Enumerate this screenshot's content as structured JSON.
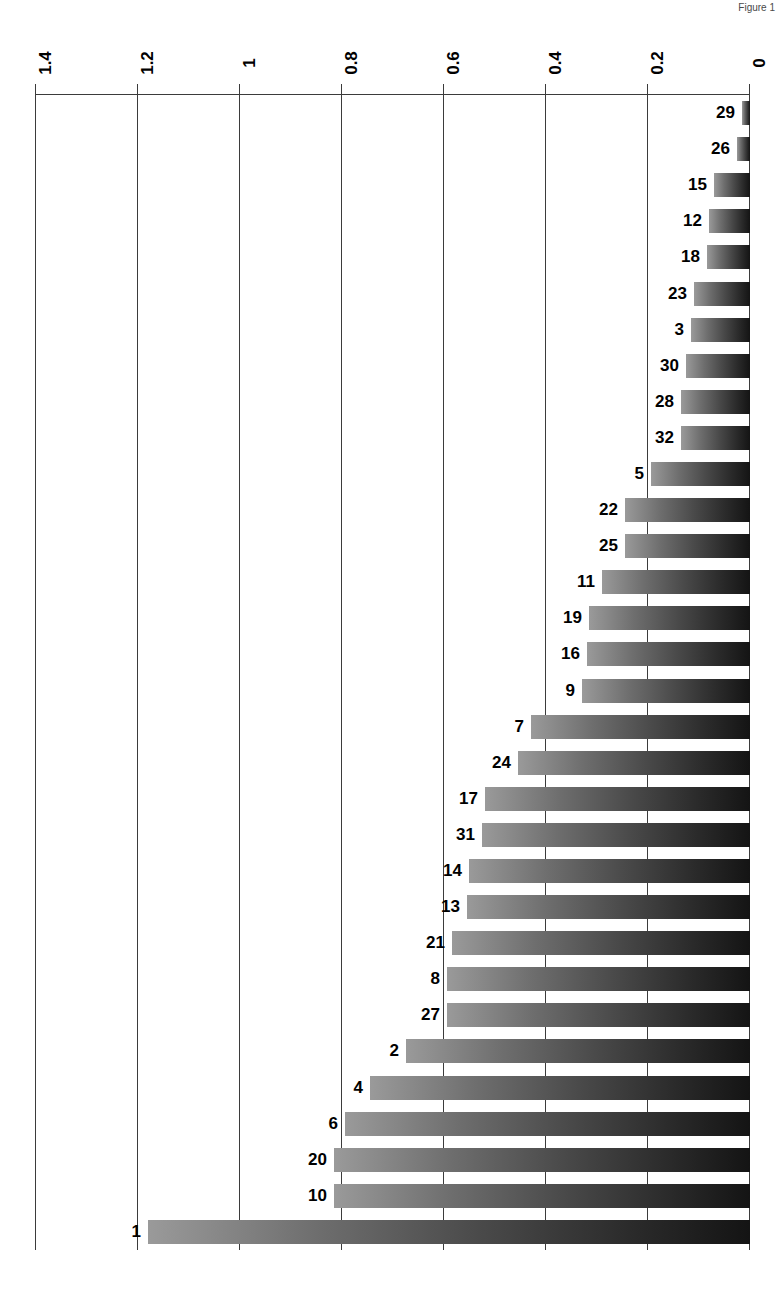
{
  "chart_data": {
    "type": "bar",
    "orientation": "horizontal",
    "title": "",
    "xlabel": "",
    "ylabel": "Aggregate differences (Early – Late) Insider to Outsider",
    "value_axis_label": "Aggregate differences (Early – Late) Insider to Outsider",
    "ticks": [
      "0",
      "0.2",
      "0.4",
      "0.6",
      "0.8",
      "1",
      "1.2",
      "1.4"
    ],
    "tick_values": [
      0,
      0.2,
      0.4,
      0.6,
      0.8,
      1,
      1.2,
      1.4
    ],
    "ylim": [
      0,
      1.4
    ],
    "grid": true,
    "legend": "none",
    "categories": [
      "1",
      "10",
      "20",
      "6",
      "4",
      "2",
      "27",
      "8",
      "21",
      "13",
      "14",
      "31",
      "17",
      "24",
      "7",
      "9",
      "16",
      "19",
      "11",
      "25",
      "22",
      "5",
      "32",
      "28",
      "30",
      "3",
      "23",
      "18",
      "12",
      "15",
      "26",
      "29"
    ],
    "values": [
      1.18,
      0.815,
      0.815,
      0.795,
      0.745,
      0.675,
      0.595,
      0.595,
      0.585,
      0.555,
      0.55,
      0.525,
      0.52,
      0.455,
      0.43,
      0.33,
      0.32,
      0.315,
      0.29,
      0.245,
      0.245,
      0.195,
      0.135,
      0.135,
      0.125,
      0.115,
      0.11,
      0.085,
      0.08,
      0.07,
      0.025,
      0.015
    ]
  },
  "figure": {
    "caption": "Figure 1"
  }
}
